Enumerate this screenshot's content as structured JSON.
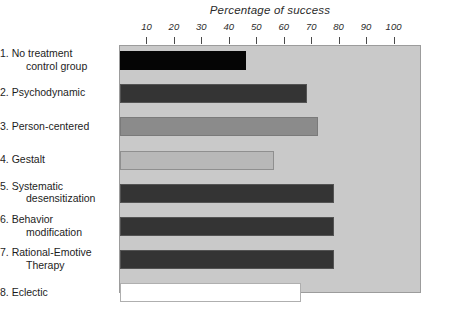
{
  "chart_data": {
    "type": "bar",
    "orientation": "horizontal",
    "title": "Percentage of success",
    "xlabel": "",
    "ylabel": "",
    "xlim": [
      0,
      110
    ],
    "xticks": [
      10,
      20,
      30,
      40,
      50,
      60,
      70,
      80,
      90,
      100
    ],
    "xtick_labels": [
      "10",
      "20",
      "30",
      "40",
      "50",
      "60",
      "70",
      "80",
      "90",
      "100"
    ],
    "grid": false,
    "legend": "none",
    "plot_background": "#c9c9c9",
    "categories": [
      "1. No treatment control group",
      "2. Psychodynamic",
      "3. Person-centered",
      "4. Gestalt",
      "5. Systematic desensitization",
      "6. Behavior modification",
      "7. Rational-Emotive Therapy",
      "8. Eclectic"
    ],
    "values": [
      46,
      68,
      72,
      56,
      78,
      78,
      78,
      66
    ],
    "bar_colors": [
      "#050505",
      "#343434",
      "#8b8b8b",
      "#b8b8b8",
      "#343434",
      "#343434",
      "#343434",
      "#ffffff"
    ]
  },
  "labels": [
    {
      "line1": "1. No treatment",
      "line2": "control group"
    },
    {
      "line1": "2. Psychodynamic",
      "line2": ""
    },
    {
      "line1": "3. Person-centered",
      "line2": ""
    },
    {
      "line1": "4. Gestalt",
      "line2": ""
    },
    {
      "line1": "5. Systematic",
      "line2": "desensitization"
    },
    {
      "line1": "6. Behavior",
      "line2": "modification"
    },
    {
      "line1": "7. Rational-Emotive",
      "line2": "Therapy"
    },
    {
      "line1": "8. Eclectic",
      "line2": ""
    }
  ]
}
